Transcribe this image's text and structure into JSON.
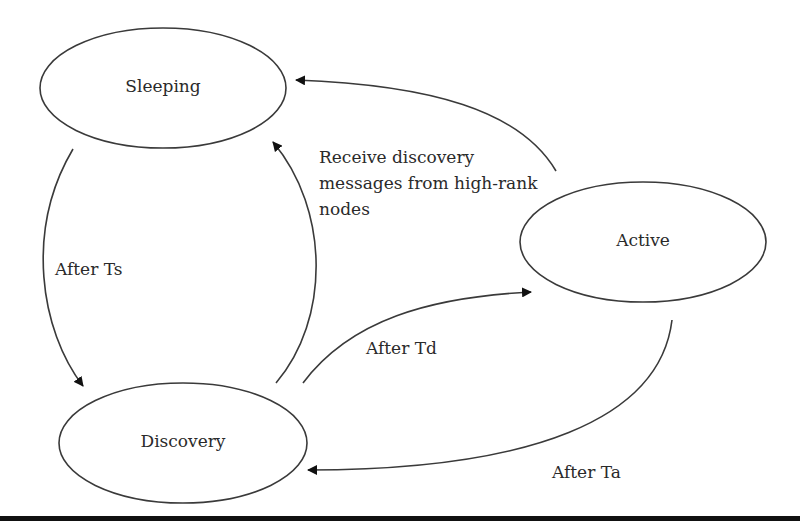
{
  "diagram": {
    "type": "state-transition",
    "states": [
      {
        "id": "sleeping",
        "label": "Sleeping"
      },
      {
        "id": "active",
        "label": "Active"
      },
      {
        "id": "discovery",
        "label": "Discovery"
      }
    ],
    "transitions": [
      {
        "from": "sleeping",
        "to": "discovery",
        "label": "After Ts"
      },
      {
        "from": "discovery",
        "to": "sleeping",
        "label_lines": [
          "Receive discovery",
          "messages from high-rank",
          "nodes"
        ]
      },
      {
        "from": "active",
        "to": "sleeping",
        "label": ""
      },
      {
        "from": "discovery",
        "to": "active",
        "label": "After Td"
      },
      {
        "from": "active",
        "to": "discovery",
        "label": "After Ta"
      }
    ]
  }
}
